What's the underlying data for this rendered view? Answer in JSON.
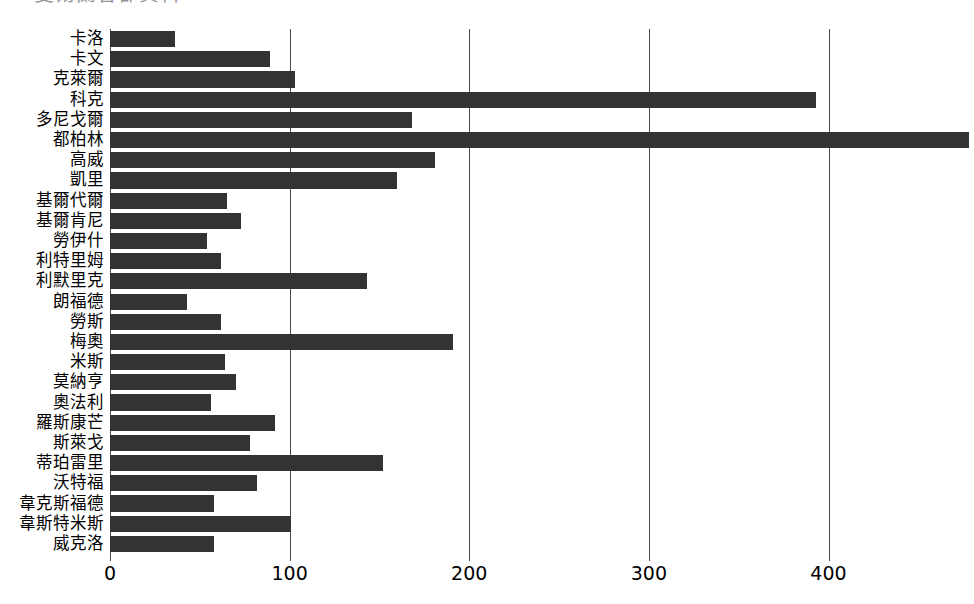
{
  "chart_title_clipped": "愛爾蘭各郡資料",
  "chart_data": {
    "type": "bar",
    "orientation": "horizontal",
    "title": "",
    "xlabel": "",
    "ylabel": "",
    "xlim": [
      0,
      481
    ],
    "xticks": [
      0,
      100,
      200,
      300,
      400
    ],
    "xticklabels": [
      "0",
      "100",
      "200",
      "300",
      "400"
    ],
    "grid": true,
    "legend": null,
    "bar_color": "#333333",
    "axis_color": "#4d4d4d",
    "background_color": "#ffffff",
    "categories": [
      "卡洛",
      "卡文",
      "克萊爾",
      "科克",
      "多尼戈爾",
      "都柏林",
      "高威",
      "凱里",
      "基爾代爾",
      "基爾肯尼",
      "勞伊什",
      "利特里姆",
      "利默里克",
      "朗福德",
      "勞斯",
      "梅奧",
      "米斯",
      "莫納亨",
      "奧法利",
      "羅斯康芒",
      "斯萊戈",
      "蒂珀雷里",
      "沃特福",
      "韋克斯福德",
      "韋斯特米斯",
      "威克洛"
    ],
    "values": [
      36,
      89,
      103,
      393,
      168,
      478,
      181,
      160,
      65,
      73,
      54,
      62,
      143,
      43,
      62,
      191,
      64,
      70,
      56,
      92,
      78,
      152,
      82,
      58,
      101,
      58
    ]
  }
}
